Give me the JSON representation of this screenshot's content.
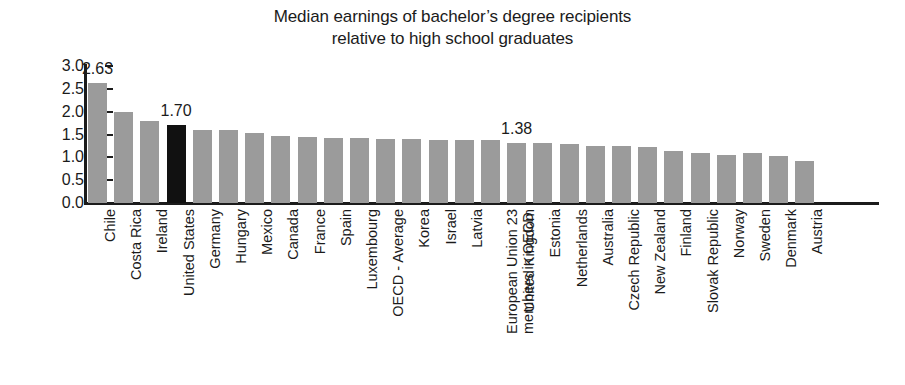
{
  "title": {
    "line1": "Median earnings of bachelor’s degree recipients",
    "line2": "relative to high school graduates"
  },
  "axis": {
    "y_ticks": [
      "3.0",
      "2.5",
      "2.0",
      "1.5",
      "1.0",
      "0.5",
      "0.0"
    ],
    "y_min": 0.0,
    "y_max": 3.0,
    "y_step": 0.5
  },
  "colors": {
    "bar": "#9b9b9b",
    "highlight": "#111111",
    "axis": "#1b1b1b",
    "text": "#1b1b1b",
    "background": "#ffffff"
  },
  "annotations": [
    {
      "text": "2.63",
      "index": 0
    },
    {
      "text": "1.70",
      "index": 3
    },
    {
      "text": "1.38",
      "index": 16
    },
    {
      "text": "1.10",
      "index": 28
    },
    {
      "text": "0.93",
      "index": 29
    }
  ],
  "chart_data": {
    "type": "bar",
    "title": "Median earnings of bachelor’s degree recipients relative to high school graduates",
    "xlabel": "",
    "ylabel": "",
    "ylim": [
      0.0,
      3.0
    ],
    "ytick_step": 0.5,
    "grid": false,
    "legend": false,
    "highlight_category": "United States",
    "categories": [
      "Chile",
      "Costa Rica",
      "Ireland",
      "United States",
      "Germany",
      "Hungary",
      "Mexico",
      "Canada",
      "France",
      "Spain",
      "Luxembourg",
      "OECD - Average",
      "Korea",
      "Israel",
      "Latvia",
      "European Union 23 members in OECD",
      "United Kingdom",
      "Estonia",
      "Netherlands",
      "Australia",
      "Czech Republic",
      "New Zealand",
      "Finland",
      "Slovak Republic",
      "Norway",
      "Sweden",
      "Denmark",
      "Austria"
    ],
    "values": [
      2.63,
      2.0,
      1.8,
      1.7,
      1.6,
      1.6,
      1.53,
      1.47,
      1.44,
      1.42,
      1.42,
      1.4,
      1.4,
      1.38,
      1.38,
      1.38,
      1.32,
      1.31,
      1.3,
      1.25,
      1.24,
      1.23,
      1.14,
      1.1,
      1.05,
      1.1,
      1.04,
      0.93
    ],
    "data_labels": {
      "Chile": "2.63",
      "United States": "1.70",
      "European Union 23 members in OECD": "1.38",
      "Sweden": "1.10",
      "Austria": "0.93"
    }
  },
  "bar_series": [
    {
      "label": "Chile",
      "value": 2.63,
      "highlight": false,
      "label_lines": [
        "Chile"
      ]
    },
    {
      "label": "Costa Rica",
      "value": 2.0,
      "highlight": false,
      "label_lines": [
        "Costa Rica"
      ]
    },
    {
      "label": "Ireland",
      "value": 1.8,
      "highlight": false,
      "label_lines": [
        "Ireland"
      ]
    },
    {
      "label": "United States",
      "value": 1.7,
      "highlight": true,
      "label_lines": [
        "United States"
      ]
    },
    {
      "label": "Germany",
      "value": 1.6,
      "highlight": false,
      "label_lines": [
        "Germany"
      ]
    },
    {
      "label": "Hungary",
      "value": 1.6,
      "highlight": false,
      "label_lines": [
        "Hungary"
      ]
    },
    {
      "label": "Mexico",
      "value": 1.53,
      "highlight": false,
      "label_lines": [
        "Mexico"
      ]
    },
    {
      "label": "Canada",
      "value": 1.47,
      "highlight": false,
      "label_lines": [
        "Canada"
      ]
    },
    {
      "label": "France",
      "value": 1.44,
      "highlight": false,
      "label_lines": [
        "France"
      ]
    },
    {
      "label": "Spain",
      "value": 1.42,
      "highlight": false,
      "label_lines": [
        "Spain"
      ]
    },
    {
      "label": "Luxembourg",
      "value": 1.42,
      "highlight": false,
      "label_lines": [
        "Luxembourg"
      ]
    },
    {
      "label": "OECD - Average",
      "value": 1.4,
      "highlight": false,
      "label_lines": [
        "OECD - Average"
      ]
    },
    {
      "label": "Korea",
      "value": 1.4,
      "highlight": false,
      "label_lines": [
        "Korea"
      ]
    },
    {
      "label": "Israel",
      "value": 1.38,
      "highlight": false,
      "label_lines": [
        "Israel"
      ]
    },
    {
      "label": "Latvia",
      "value": 1.38,
      "highlight": false,
      "label_lines": [
        "Latvia"
      ]
    },
    {
      "label": "European Union 23 members in OECD",
      "value": 1.38,
      "highlight": false,
      "label_lines": [
        "European Union 23",
        "members in OECD"
      ]
    },
    {
      "label": "United Kingdom",
      "value": 1.32,
      "highlight": false,
      "label_lines": [
        "United Kingdom"
      ]
    },
    {
      "label": "Estonia",
      "value": 1.31,
      "highlight": false,
      "label_lines": [
        "Estonia"
      ]
    },
    {
      "label": "Netherlands",
      "value": 1.3,
      "highlight": false,
      "label_lines": [
        "Netherlands"
      ]
    },
    {
      "label": "Australia",
      "value": 1.25,
      "highlight": false,
      "label_lines": [
        "Australia"
      ]
    },
    {
      "label": "Czech Republic",
      "value": 1.24,
      "highlight": false,
      "label_lines": [
        "Czech Republic"
      ]
    },
    {
      "label": "New Zealand",
      "value": 1.23,
      "highlight": false,
      "label_lines": [
        "New Zealand"
      ]
    },
    {
      "label": "Finland",
      "value": 1.14,
      "highlight": false,
      "label_lines": [
        "Finland"
      ]
    },
    {
      "label": "Slovak Republic",
      "value": 1.1,
      "highlight": false,
      "label_lines": [
        "Slovak Republic"
      ]
    },
    {
      "label": "Norway",
      "value": 1.05,
      "highlight": false,
      "label_lines": [
        "Norway"
      ]
    },
    {
      "label": "Sweden",
      "value": 1.1,
      "highlight": false,
      "label_lines": [
        "Sweden"
      ]
    },
    {
      "label": "Denmark",
      "value": 1.04,
      "highlight": false,
      "label_lines": [
        "Denmark"
      ]
    },
    {
      "label": "Austria",
      "value": 0.93,
      "highlight": false,
      "label_lines": [
        "Austria"
      ]
    }
  ]
}
